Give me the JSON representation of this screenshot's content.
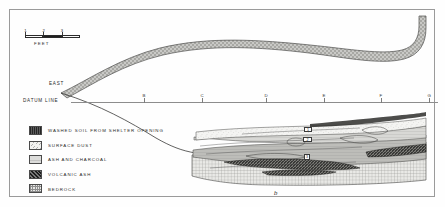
{
  "figure": {
    "letter": "b",
    "orientation_label": "EAST",
    "datum_label": "DATUM  LINE"
  },
  "scale": {
    "unit_label": "FEET",
    "ticks": [
      "1",
      "2",
      "3"
    ]
  },
  "datum": {
    "stations": [
      {
        "label": "B",
        "x": 134
      },
      {
        "label": "C",
        "x": 192
      },
      {
        "label": "D",
        "x": 256
      },
      {
        "label": "E",
        "x": 314
      },
      {
        "label": "F",
        "x": 371
      },
      {
        "label": "G",
        "x": 427
      }
    ]
  },
  "legend": {
    "items": [
      {
        "label": "WASHED  SOIL  FROM  SHELTER  OPENING",
        "pattern": "sw-washed",
        "color": "#333333"
      },
      {
        "label": "SURFACE  DUST",
        "pattern": "sw-dust",
        "color": "#f2f2f0"
      },
      {
        "label": "ASH  AND  CHARCOAL",
        "pattern": "sw-ash",
        "color": "#dcdcda"
      },
      {
        "label": "VOLCANIC  ASH",
        "pattern": "sw-volcanic",
        "color": "#2e2e2e"
      },
      {
        "label": "BEDROCK",
        "pattern": "sw-bedrock",
        "color": "#e8e8e6"
      }
    ]
  },
  "samples": [
    {
      "label": "1",
      "x": 303,
      "y": 126
    },
    {
      "label": "2",
      "x": 302,
      "y": 136
    },
    {
      "label": "3",
      "x": 303,
      "y": 153
    }
  ],
  "colors": {
    "frame": "#9a9a9a",
    "datum_line": "#8d8d8d",
    "washed_band": "#c9c9c6",
    "ink": "#1a1a1a"
  }
}
